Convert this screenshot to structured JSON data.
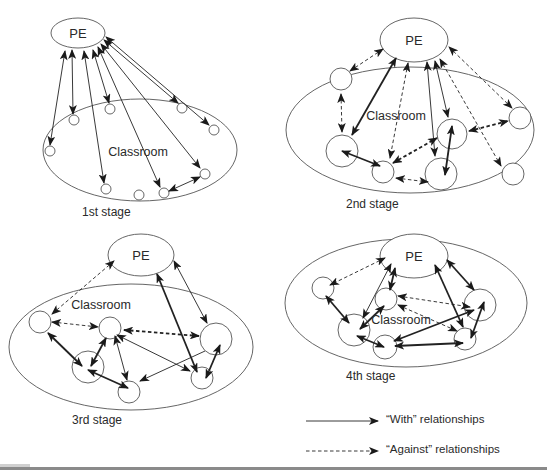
{
  "figure": {
    "stages": [
      {
        "id": "stage1",
        "label": "1st stage",
        "label_pos": [
          82,
          206
        ],
        "pe": {
          "label": "PE",
          "cx": 78,
          "cy": 33,
          "rx": 27,
          "ry": 15
        },
        "classroom": {
          "label": "Classroom",
          "cx": 140,
          "cy": 150,
          "rx": 97,
          "ry": 51,
          "label_pos": [
            138,
            152
          ]
        },
        "students": [
          {
            "cx": 50,
            "cy": 151,
            "r": 5
          },
          {
            "cx": 74,
            "cy": 120,
            "r": 5
          },
          {
            "cx": 110,
            "cy": 109,
            "r": 5
          },
          {
            "cx": 182,
            "cy": 108,
            "r": 5
          },
          {
            "cx": 214,
            "cy": 130,
            "r": 5
          },
          {
            "cx": 106,
            "cy": 189,
            "r": 5
          },
          {
            "cx": 139,
            "cy": 195,
            "r": 5
          },
          {
            "cx": 164,
            "cy": 193,
            "r": 5
          },
          {
            "cx": 205,
            "cy": 174,
            "r": 5
          }
        ],
        "edges": [
          {
            "from": [
              65,
              51
            ],
            "to": [
              50,
              145
            ],
            "type": "with",
            "heads": "both"
          },
          {
            "from": [
              72,
              50
            ],
            "to": [
              73,
              114
            ],
            "type": "with",
            "heads": "both"
          },
          {
            "from": [
              84,
              51
            ],
            "to": [
              104,
              183
            ],
            "type": "with",
            "heads": "both"
          },
          {
            "from": [
              93,
              50
            ],
            "to": [
              109,
              103
            ],
            "type": "with",
            "heads": "both"
          },
          {
            "from": [
              98,
              47
            ],
            "to": [
              160,
              187
            ],
            "type": "with",
            "heads": "both"
          },
          {
            "from": [
              101,
              44
            ],
            "to": [
              200,
              168
            ],
            "type": "with",
            "heads": "both"
          },
          {
            "from": [
              104,
              40
            ],
            "to": [
              178,
              103
            ],
            "type": "with",
            "heads": "both"
          },
          {
            "from": [
              106,
              37
            ],
            "to": [
              209,
              125
            ],
            "type": "with",
            "heads": "both"
          },
          {
            "from": [
              169,
              191
            ],
            "to": [
              200,
              177
            ],
            "type": "with",
            "heads": "both"
          }
        ]
      },
      {
        "id": "stage2",
        "label": "2nd stage",
        "label_pos": [
          346,
          198
        ],
        "pe": {
          "label": "PE",
          "cx": 414,
          "cy": 40,
          "rx": 34,
          "ry": 22
        },
        "classroom": {
          "label": "Classroom",
          "cx": 410,
          "cy": 130,
          "rx": 124,
          "ry": 63,
          "label_pos": [
            396,
            116
          ]
        },
        "students": [
          {
            "cx": 341,
            "cy": 79,
            "r": 11
          },
          {
            "cx": 342,
            "cy": 151,
            "r": 16
          },
          {
            "cx": 383,
            "cy": 172,
            "r": 11
          },
          {
            "cx": 452,
            "cy": 134,
            "r": 15
          },
          {
            "cx": 441,
            "cy": 174,
            "r": 16
          },
          {
            "cx": 520,
            "cy": 118,
            "r": 11
          },
          {
            "cx": 513,
            "cy": 174,
            "r": 11
          }
        ],
        "edges": [
          {
            "from": [
              383,
              49
            ],
            "to": [
              350,
              71
            ],
            "type": "against",
            "heads": "both"
          },
          {
            "from": [
              341,
              94
            ],
            "to": [
              342,
              132
            ],
            "type": "against",
            "heads": "both"
          },
          {
            "from": [
              396,
              58
            ],
            "to": [
              352,
              135
            ],
            "type": "with",
            "heads": "both",
            "bold": true
          },
          {
            "from": [
              408,
              63
            ],
            "to": [
              390,
              158
            ],
            "type": "against",
            "heads": "end-start"
          },
          {
            "from": [
              427,
              62
            ],
            "to": [
              435,
              156
            ],
            "type": "with",
            "heads": "both"
          },
          {
            "from": [
              435,
              61
            ],
            "to": [
              448,
              117
            ],
            "type": "with",
            "heads": "both"
          },
          {
            "from": [
              440,
              59
            ],
            "to": [
              501,
              166
            ],
            "type": "against",
            "heads": "both"
          },
          {
            "from": [
              449,
              47
            ],
            "to": [
              512,
              108
            ],
            "type": "against",
            "heads": "both"
          },
          {
            "from": [
              342,
              151
            ],
            "to": [
              380,
              166
            ],
            "type": "with",
            "heads": "both",
            "bold": true
          },
          {
            "from": [
              393,
              163
            ],
            "to": [
              437,
              138
            ],
            "type": "against",
            "heads": "both",
            "bold": true
          },
          {
            "from": [
              396,
              178
            ],
            "to": [
              428,
              182
            ],
            "type": "against",
            "heads": "both"
          },
          {
            "from": [
              452,
              126
            ],
            "to": [
              445,
              175
            ],
            "type": "with",
            "heads": "both",
            "bold": true
          },
          {
            "from": [
              469,
              131
            ],
            "to": [
              508,
              121
            ],
            "type": "against",
            "heads": "both",
            "bold": true
          }
        ]
      },
      {
        "id": "stage3",
        "label": "3rd stage",
        "label_pos": [
          72,
          414
        ],
        "pe": {
          "label": "PE",
          "cx": 141,
          "cy": 255,
          "rx": 33,
          "ry": 21
        },
        "classroom": {
          "label": "Classroom",
          "cx": 131,
          "cy": 347,
          "rx": 122,
          "ry": 63,
          "label_pos": [
            101,
            305
          ]
        },
        "students": [
          {
            "cx": 40,
            "cy": 322,
            "r": 11
          },
          {
            "cx": 110,
            "cy": 328,
            "r": 11
          },
          {
            "cx": 88,
            "cy": 367,
            "r": 16
          },
          {
            "cx": 129,
            "cy": 392,
            "r": 11
          },
          {
            "cx": 216,
            "cy": 339,
            "r": 16
          },
          {
            "cx": 202,
            "cy": 378,
            "r": 11
          }
        ],
        "edges": [
          {
            "from": [
              114,
              261
            ],
            "to": [
              52,
              314
            ],
            "type": "against",
            "heads": "both"
          },
          {
            "from": [
              52,
              322
            ],
            "to": [
              98,
              327
            ],
            "type": "against",
            "heads": "both"
          },
          {
            "from": [
              124,
              330
            ],
            "to": [
              199,
              336
            ],
            "type": "against",
            "heads": "both",
            "bold": true
          },
          {
            "from": [
              157,
              274
            ],
            "to": [
              197,
              372
            ],
            "type": "with",
            "heads": "both",
            "bold": true
          },
          {
            "from": [
              174,
              261
            ],
            "to": [
              207,
              323
            ],
            "type": "with",
            "heads": "both"
          },
          {
            "from": [
              48,
              333
            ],
            "to": [
              82,
              366
            ],
            "type": "with",
            "heads": "both",
            "bold": true
          },
          {
            "from": [
              106,
              338
            ],
            "to": [
              91,
              366
            ],
            "type": "with",
            "heads": "both",
            "bold": true
          },
          {
            "from": [
              115,
              336
            ],
            "to": [
              127,
              380
            ],
            "type": "with",
            "heads": "both"
          },
          {
            "from": [
              117,
              335
            ],
            "to": [
              190,
              371
            ],
            "type": "with",
            "heads": "both"
          },
          {
            "from": [
              88,
              370
            ],
            "to": [
              128,
              388
            ],
            "type": "with",
            "heads": "both",
            "bold": true
          },
          {
            "from": [
              205,
              351
            ],
            "to": [
              140,
              381
            ],
            "type": "with",
            "heads": "end"
          },
          {
            "from": [
              220,
              345
            ],
            "to": [
              206,
              378
            ],
            "type": "with",
            "heads": "both",
            "bold": true
          }
        ]
      },
      {
        "id": "stage4",
        "label": "4th stage",
        "label_pos": [
          346,
          370
        ],
        "pe": {
          "label": "PE",
          "cx": 414,
          "cy": 256,
          "rx": 34,
          "ry": 22
        },
        "classroom": {
          "label": "Classroom",
          "cx": 406,
          "cy": 303,
          "rx": 121,
          "ry": 64,
          "label_pos": [
            401,
            320
          ]
        },
        "students": [
          {
            "cx": 323,
            "cy": 288,
            "r": 11
          },
          {
            "cx": 386,
            "cy": 299,
            "r": 11
          },
          {
            "cx": 354,
            "cy": 330,
            "r": 16
          },
          {
            "cx": 385,
            "cy": 347,
            "r": 12
          },
          {
            "cx": 480,
            "cy": 305,
            "r": 16
          },
          {
            "cx": 465,
            "cy": 339,
            "r": 11
          }
        ],
        "edges": [
          {
            "from": [
              385,
              258
            ],
            "to": [
              330,
              285
            ],
            "type": "against",
            "heads": "both"
          },
          {
            "from": [
              391,
              264
            ],
            "to": [
              363,
              318
            ],
            "type": "with",
            "heads": "both"
          },
          {
            "from": [
              395,
              268
            ],
            "to": [
              390,
              290
            ],
            "type": "with",
            "heads": "both",
            "bold": true
          },
          {
            "from": [
              435,
              265
            ],
            "to": [
              463,
              327
            ],
            "type": "with",
            "heads": "both",
            "bold": true
          },
          {
            "from": [
              447,
              260
            ],
            "to": [
              474,
              290
            ],
            "type": "with",
            "heads": "both",
            "bold": true
          },
          {
            "from": [
              326,
              296
            ],
            "to": [
              349,
              323
            ],
            "type": "with",
            "heads": "both",
            "bold": true
          },
          {
            "from": [
              384,
              306
            ],
            "to": [
              360,
              329
            ],
            "type": "with",
            "heads": "both",
            "bold": true
          },
          {
            "from": [
              398,
              296
            ],
            "to": [
              470,
              307
            ],
            "type": "against",
            "heads": "both"
          },
          {
            "from": [
              398,
              305
            ],
            "to": [
              457,
              331
            ],
            "type": "against",
            "heads": "both"
          },
          {
            "from": [
              357,
              336
            ],
            "to": [
              384,
              347
            ],
            "type": "with",
            "heads": "both",
            "bold": true
          },
          {
            "from": [
              395,
              346
            ],
            "to": [
              463,
              343
            ],
            "type": "with",
            "heads": "both",
            "bold": true
          },
          {
            "from": [
              394,
              341
            ],
            "to": [
              474,
              310
            ],
            "type": "with",
            "heads": "both",
            "bold": true
          },
          {
            "from": [
              484,
              302
            ],
            "to": [
              471,
              338
            ],
            "type": "with",
            "heads": "both",
            "bold": true
          }
        ]
      }
    ],
    "legend": {
      "items": [
        {
          "type": "with",
          "label": "“With” relationships",
          "y": 421,
          "x1": 306,
          "x2": 378,
          "label_x": 386
        },
        {
          "type": "against",
          "label": "“Against” relationships",
          "y": 451,
          "x1": 306,
          "x2": 378,
          "label_x": 386
        }
      ]
    },
    "colors": {
      "stroke": "#222222",
      "ellipse_stroke": "#555555",
      "text": "#2a2a2a",
      "background": "#ffffff",
      "bottom_rule": "#8a8a8a"
    }
  }
}
